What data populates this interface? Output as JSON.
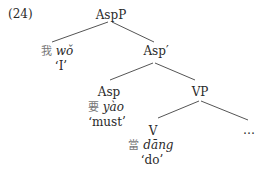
{
  "example_number": "(24)",
  "tree": {
    "root": {
      "label": "AspP"
    },
    "spec": {
      "hanzi": "我",
      "pinyin": "wǒ",
      "gloss": "‘I’"
    },
    "asp_bar": {
      "label": "Asp′"
    },
    "asp": {
      "label": "Asp",
      "hanzi": "要",
      "pinyin": "yào",
      "gloss": "‘must’"
    },
    "vp": {
      "label": "VP"
    },
    "v": {
      "label": "V",
      "hanzi": "當",
      "pinyin": "dāng",
      "gloss": "‘do’"
    },
    "ellipsis": {
      "label": "…"
    }
  }
}
